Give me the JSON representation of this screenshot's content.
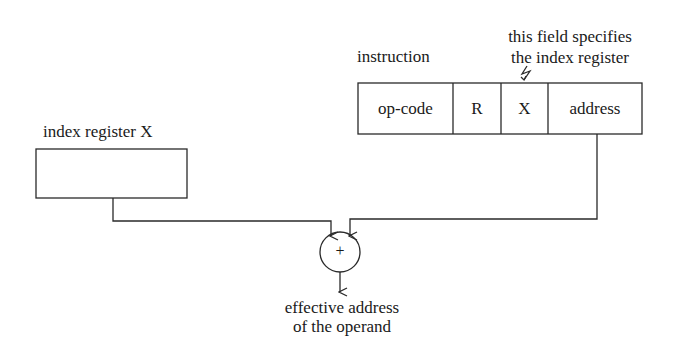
{
  "diagram": {
    "instruction": {
      "label": "instruction",
      "fields": [
        {
          "id": "opcode",
          "label": "op-code"
        },
        {
          "id": "r",
          "label": "R"
        },
        {
          "id": "x",
          "label": "X"
        },
        {
          "id": "address",
          "label": "address"
        }
      ]
    },
    "annotation": {
      "line1": "this field specifies",
      "line2": "the index register"
    },
    "index_register": {
      "label": "index register X",
      "value": ""
    },
    "adder": {
      "symbol": "+"
    },
    "output": {
      "line1": "effective address",
      "line2": "of the operand"
    },
    "colors": {
      "stroke": "#2a2a2a",
      "background": "#ffffff"
    }
  }
}
